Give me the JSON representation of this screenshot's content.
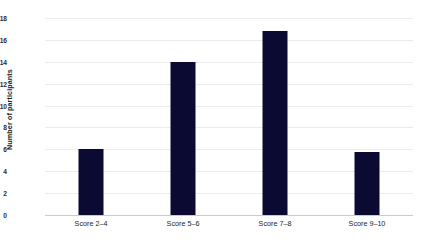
{
  "chart_data": {
    "type": "bar",
    "title": "",
    "xlabel": "",
    "ylabel": "Number of participants",
    "categories": [
      "Score 2–4",
      "Score 5–6",
      "Score 7–8",
      "Score 9–10"
    ],
    "values": [
      6.0,
      14.0,
      16.8,
      5.8
    ],
    "ylim": [
      0,
      18
    ],
    "ytick_labels": [
      "18",
      "16",
      "14",
      "12",
      "10",
      "8",
      "6",
      "4",
      "2",
      "0"
    ],
    "ytick_values": [
      18,
      16,
      14,
      12,
      10,
      8,
      6,
      4,
      2,
      0
    ],
    "grid": true,
    "legend": "none",
    "bar_color": "#0a0a32",
    "gridline_color": "#ebebeb",
    "axis_color": "#c9c9cf",
    "background_color": "#ffffff",
    "text_color": "#1d1d26"
  }
}
